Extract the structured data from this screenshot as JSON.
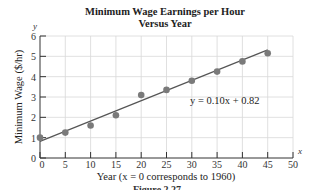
{
  "chart_data": {
    "type": "scatter",
    "title": "Minimum Wage Earnings per Hour",
    "subtitle": "Versus Year",
    "xlabel": "Year (x = 0 corresponds to 1960)",
    "ylabel": "Minimum Wage ($/hr)",
    "x_axis_var": "x",
    "y_axis_var": "y",
    "xlim": [
      0,
      50
    ],
    "ylim": [
      0,
      6
    ],
    "x_ticks": [
      0,
      5,
      10,
      15,
      20,
      25,
      30,
      35,
      40,
      45,
      50
    ],
    "y_ticks": [
      0,
      1,
      2,
      3,
      4,
      5,
      6
    ],
    "grid": true,
    "series": [
      {
        "name": "Minimum wage",
        "x": [
          0,
          5,
          10,
          15,
          20,
          25,
          30,
          35,
          40,
          45
        ],
        "y": [
          1.0,
          1.25,
          1.6,
          2.1,
          3.1,
          3.35,
          3.8,
          4.25,
          4.75,
          5.15
        ]
      }
    ],
    "trendline": {
      "equation": "y = 0.10x + 0.82",
      "slope": 0.1,
      "intercept": 0.82,
      "x_range": [
        0,
        45
      ]
    },
    "annotations": [
      "y = 0.10x + 0.82"
    ],
    "colors": {
      "points": "#7a7a7a",
      "line": "#555555",
      "grid": "#d8d8d8",
      "axis": "#333333"
    }
  },
  "labels": {
    "title_line1": "Minimum Wage Earnings per Hour",
    "title_line2": "Versus Year",
    "equation": "y = 0.10x + 0.82",
    "x_label": "Year (x = 0 corresponds to 1960)",
    "y_label": "Minimum Wage ($/hr)",
    "x_var": "x",
    "y_var": "y",
    "caption": "Figure 2.27"
  }
}
